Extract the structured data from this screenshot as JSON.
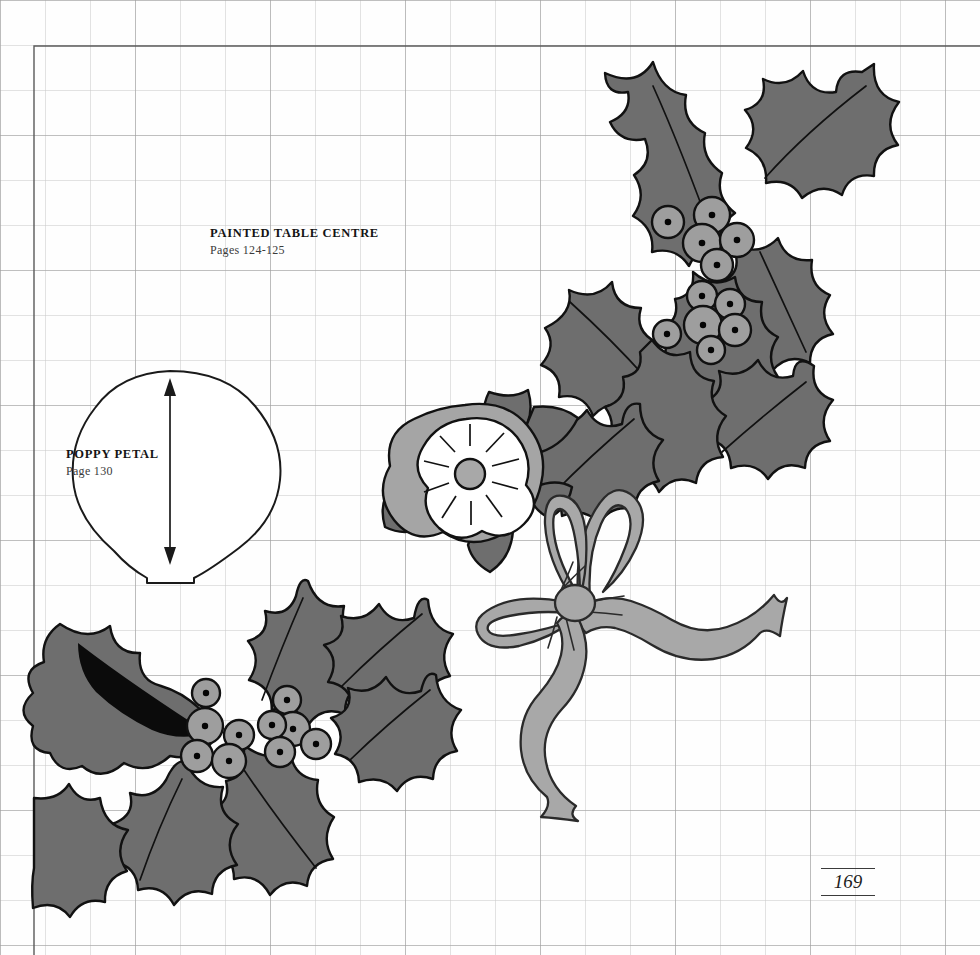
{
  "page": {
    "folio_number": "169",
    "background_color": "#fefefe",
    "grid": {
      "cell_size_px": 45,
      "line_color": "#c2c2c2",
      "major_line_color": "#9a9a9a",
      "major_every": 3
    },
    "frame": {
      "color": "#5a5a5a",
      "left": 34,
      "top": 46
    }
  },
  "labels": [
    {
      "name": "painted-table-centre",
      "title": "PAINTED TABLE CENTRE",
      "subtitle": "Pages 124-125"
    },
    {
      "name": "poppy-petal",
      "title": "POPPY PETAL",
      "subtitle": "Page 130"
    }
  ],
  "palette": {
    "leaf_fill": "#6e6e6e",
    "leaf_dark_shade": "#0b0b0b",
    "berry_fill": "#9e9e9e",
    "berry_dot": "#050505",
    "ribbon_fill": "#a8a8a8",
    "petal_front_fill": "#ffffff",
    "petal_back_fill": "#a5a5a5",
    "flower_centre_fill": "#a8a8a8",
    "outline": "#111111",
    "template_outline": "#1a1a1a"
  },
  "motifs": [
    {
      "name": "holly-spray-upper-right",
      "description": "Holly leaves with berry clusters"
    },
    {
      "name": "holly-spray-lower-left",
      "description": "Holly leaves with berry clusters and shaded leaf"
    },
    {
      "name": "flower-motif",
      "description": "Five petal flower with rayed centre"
    },
    {
      "name": "ribbon-bow",
      "description": "Ribbon bow with two loops and two tails"
    },
    {
      "name": "poppy-petal-template",
      "description": "Cutting template outline with grain arrow"
    }
  ]
}
